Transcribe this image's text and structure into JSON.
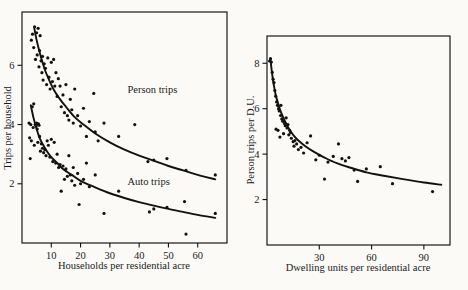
{
  "figure": {
    "background_color": "#fbfaf7",
    "ink_color": "#111111",
    "panel_count": 2
  },
  "chart_data": [
    {
      "id": "left",
      "type": "scatter",
      "title": "",
      "xlabel": "Households per residential acre",
      "ylabel": "Trips per household",
      "xlim": [
        0,
        70
      ],
      "ylim": [
        0,
        7.8
      ],
      "xticks": [
        10,
        20,
        30,
        40,
        50,
        60
      ],
      "yticks": [
        2,
        4,
        6
      ],
      "grid": false,
      "legend": "inline-annotations",
      "annotations": [
        {
          "text": "Person trips",
          "x": 36,
          "y": 5.05
        },
        {
          "text": "Auto trips",
          "x": 36,
          "y": 1.95
        }
      ],
      "series": [
        {
          "name": "Person trips",
          "kind": "scatter+fit",
          "fit_label": "Person trips",
          "fit_type": "power-decay",
          "fit_points": [
            [
              4.2,
              7.25
            ],
            [
              5.0,
              6.85
            ],
            [
              6.0,
              6.45
            ],
            [
              7.0,
              6.1
            ],
            [
              8.0,
              5.8
            ],
            [
              9.5,
              5.45
            ],
            [
              11.0,
              5.15
            ],
            [
              13.0,
              4.85
            ],
            [
              15.0,
              4.6
            ],
            [
              18.0,
              4.25
            ],
            [
              21.0,
              4.0
            ],
            [
              25.0,
              3.7
            ],
            [
              30.0,
              3.4
            ],
            [
              35.0,
              3.15
            ],
            [
              40.0,
              2.95
            ],
            [
              45.0,
              2.78
            ],
            [
              50.0,
              2.6
            ],
            [
              55.0,
              2.45
            ],
            [
              60.0,
              2.3
            ],
            [
              66.0,
              2.15
            ]
          ],
          "points": [
            [
              3.2,
              6.85
            ],
            [
              3.6,
              7.05
            ],
            [
              4.0,
              6.6
            ],
            [
              4.3,
              7.3
            ],
            [
              4.6,
              6.2
            ],
            [
              5.0,
              7.1
            ],
            [
              5.2,
              6.35
            ],
            [
              5.5,
              7.25
            ],
            [
              5.8,
              5.95
            ],
            [
              6.0,
              6.5
            ],
            [
              6.2,
              7.0
            ],
            [
              6.5,
              6.15
            ],
            [
              6.8,
              5.75
            ],
            [
              7.0,
              6.3
            ],
            [
              7.2,
              5.5
            ],
            [
              7.6,
              6.05
            ],
            [
              8.0,
              5.9
            ],
            [
              8.4,
              5.35
            ],
            [
              8.8,
              6.25
            ],
            [
              9.2,
              5.6
            ],
            [
              9.6,
              5.2
            ],
            [
              10.0,
              6.1
            ],
            [
              10.4,
              5.45
            ],
            [
              10.8,
              6.2
            ],
            [
              11.2,
              5.3
            ],
            [
              11.6,
              5.75
            ],
            [
              12.0,
              4.95
            ],
            [
              12.4,
              5.55
            ],
            [
              13.0,
              5.3
            ],
            [
              13.4,
              4.6
            ],
            [
              14.0,
              5.0
            ],
            [
              14.5,
              4.4
            ],
            [
              15.0,
              5.35
            ],
            [
              15.5,
              4.3
            ],
            [
              16.0,
              4.15
            ],
            [
              16.5,
              4.85
            ],
            [
              17.0,
              4.5
            ],
            [
              17.5,
              4.05
            ],
            [
              18.0,
              5.2
            ],
            [
              19.0,
              4.3
            ],
            [
              20.0,
              3.95
            ],
            [
              21.0,
              4.55
            ],
            [
              22.0,
              3.6
            ],
            [
              23.0,
              4.1
            ],
            [
              24.5,
              5.05
            ],
            [
              25.0,
              3.75
            ],
            [
              26.0,
              3.45
            ],
            [
              28.0,
              4.05
            ],
            [
              33.0,
              3.6
            ],
            [
              38.5,
              4.0
            ],
            [
              43.0,
              2.75
            ],
            [
              45.0,
              2.8
            ],
            [
              49.5,
              2.85
            ],
            [
              56.0,
              2.45
            ],
            [
              66.0,
              2.3
            ]
          ]
        },
        {
          "name": "Auto trips",
          "kind": "scatter+fit",
          "fit_label": "Auto trips",
          "fit_type": "power-decay",
          "fit_points": [
            [
              3.0,
              4.65
            ],
            [
              4.0,
              4.2
            ],
            [
              5.0,
              3.85
            ],
            [
              6.0,
              3.55
            ],
            [
              7.0,
              3.35
            ],
            [
              8.5,
              3.1
            ],
            [
              10.0,
              2.9
            ],
            [
              12.0,
              2.7
            ],
            [
              14.0,
              2.5
            ],
            [
              17.0,
              2.3
            ],
            [
              20.0,
              2.1
            ],
            [
              25.0,
              1.88
            ],
            [
              30.0,
              1.68
            ],
            [
              35.0,
              1.52
            ],
            [
              40.0,
              1.38
            ],
            [
              45.0,
              1.26
            ],
            [
              50.0,
              1.15
            ],
            [
              55.0,
              1.05
            ],
            [
              60.0,
              0.95
            ],
            [
              66.0,
              0.85
            ]
          ],
          "points": [
            [
              2.4,
              4.05
            ],
            [
              2.6,
              3.55
            ],
            [
              2.8,
              2.85
            ],
            [
              3.0,
              4.0
            ],
            [
              3.2,
              3.45
            ],
            [
              3.5,
              4.6
            ],
            [
              3.8,
              3.9
            ],
            [
              4.0,
              4.7
            ],
            [
              4.2,
              3.3
            ],
            [
              4.5,
              4.0
            ],
            [
              4.8,
              3.95
            ],
            [
              5.0,
              4.05
            ],
            [
              5.2,
              3.85
            ],
            [
              5.4,
              3.4
            ],
            [
              5.6,
              4.02
            ],
            [
              5.8,
              3.98
            ],
            [
              6.0,
              3.6
            ],
            [
              6.3,
              3.1
            ],
            [
              6.6,
              3.35
            ],
            [
              7.0,
              3.2
            ],
            [
              7.4,
              3.05
            ],
            [
              7.8,
              3.15
            ],
            [
              8.2,
              2.95
            ],
            [
              8.6,
              3.45
            ],
            [
              9.0,
              3.3
            ],
            [
              9.5,
              2.9
            ],
            [
              10.0,
              3.5
            ],
            [
              10.5,
              2.75
            ],
            [
              11.0,
              3.4
            ],
            [
              11.5,
              2.7
            ],
            [
              12.0,
              3.0
            ],
            [
              12.5,
              2.55
            ],
            [
              13.0,
              2.65
            ],
            [
              13.4,
              1.75
            ],
            [
              14.0,
              2.6
            ],
            [
              14.5,
              2.15
            ],
            [
              15.0,
              2.5
            ],
            [
              15.5,
              2.25
            ],
            [
              16.0,
              2.95
            ],
            [
              16.5,
              2.3
            ],
            [
              17.0,
              2.1
            ],
            [
              17.5,
              2.55
            ],
            [
              18.0,
              1.95
            ],
            [
              19.0,
              2.35
            ],
            [
              19.5,
              1.3
            ],
            [
              20.0,
              2.0
            ],
            [
              21.0,
              2.15
            ],
            [
              22.0,
              2.7
            ],
            [
              23.0,
              1.9
            ],
            [
              25.0,
              2.3
            ],
            [
              28.0,
              1.0
            ],
            [
              33.0,
              1.75
            ],
            [
              43.5,
              1.05
            ],
            [
              45.0,
              1.15
            ],
            [
              49.5,
              1.2
            ],
            [
              55.5,
              1.4
            ],
            [
              56.0,
              0.3
            ],
            [
              66.0,
              1.0
            ]
          ]
        }
      ]
    },
    {
      "id": "right",
      "type": "scatter",
      "title": "",
      "xlabel": "Dwelling units per residential acre",
      "ylabel": "Person trips per D.U.",
      "xlim": [
        0,
        105
      ],
      "ylim": [
        0,
        9.2
      ],
      "xticks": [
        30,
        60,
        90
      ],
      "yticks": [
        2,
        4,
        6,
        8
      ],
      "grid": false,
      "legend": "none",
      "annotations": [],
      "series": [
        {
          "name": "Person trips per D.U.",
          "kind": "scatter+fit",
          "fit_type": "power-decay",
          "fit_points": [
            [
              2.0,
              8.15
            ],
            [
              3.0,
              7.5
            ],
            [
              4.0,
              7.0
            ],
            [
              5.0,
              6.6
            ],
            [
              6.5,
              6.2
            ],
            [
              8.0,
              5.85
            ],
            [
              10.0,
              5.5
            ],
            [
              12.0,
              5.2
            ],
            [
              15.0,
              4.85
            ],
            [
              18.0,
              4.6
            ],
            [
              22.0,
              4.35
            ],
            [
              27.0,
              4.1
            ],
            [
              33.0,
              3.85
            ],
            [
              40.0,
              3.6
            ],
            [
              48.0,
              3.4
            ],
            [
              57.0,
              3.2
            ],
            [
              67.0,
              3.05
            ],
            [
              78.0,
              2.9
            ],
            [
              90.0,
              2.75
            ],
            [
              100.0,
              2.65
            ]
          ],
          "points": [
            [
              1.5,
              8.1
            ],
            [
              2.0,
              8.2
            ],
            [
              2.5,
              8.05
            ],
            [
              3.0,
              7.6
            ],
            [
              3.5,
              7.3
            ],
            [
              4.0,
              7.15
            ],
            [
              4.5,
              6.8
            ],
            [
              5.0,
              6.55
            ],
            [
              5.2,
              5.1
            ],
            [
              5.5,
              6.3
            ],
            [
              6.0,
              6.15
            ],
            [
              6.3,
              5.05
            ],
            [
              6.6,
              6.0
            ],
            [
              7.0,
              5.9
            ],
            [
              7.4,
              4.75
            ],
            [
              7.8,
              5.7
            ],
            [
              8.0,
              6.15
            ],
            [
              8.5,
              5.55
            ],
            [
              9.0,
              5.45
            ],
            [
              9.5,
              4.9
            ],
            [
              10.0,
              5.35
            ],
            [
              10.5,
              5.25
            ],
            [
              11.0,
              5.6
            ],
            [
              11.5,
              5.15
            ],
            [
              12.0,
              5.3
            ],
            [
              12.5,
              4.85
            ],
            [
              13.0,
              5.05
            ],
            [
              13.5,
              4.95
            ],
            [
              14.0,
              4.7
            ],
            [
              15.0,
              4.55
            ],
            [
              15.5,
              4.35
            ],
            [
              16.0,
              4.6
            ],
            [
              17.0,
              4.45
            ],
            [
              18.0,
              4.2
            ],
            [
              19.5,
              4.3
            ],
            [
              21.0,
              4.05
            ],
            [
              23.0,
              4.5
            ],
            [
              25.0,
              4.8
            ],
            [
              28.0,
              3.75
            ],
            [
              30.0,
              3.95
            ],
            [
              33.0,
              2.9
            ],
            [
              35.0,
              3.65
            ],
            [
              38.0,
              3.9
            ],
            [
              41.0,
              4.45
            ],
            [
              43.0,
              3.8
            ],
            [
              45.0,
              3.7
            ],
            [
              47.0,
              3.85
            ],
            [
              50.0,
              3.3
            ],
            [
              52.0,
              2.8
            ],
            [
              57.0,
              3.35
            ],
            [
              65.0,
              3.45
            ],
            [
              72.0,
              2.7
            ],
            [
              95.0,
              2.35
            ]
          ]
        }
      ]
    }
  ]
}
